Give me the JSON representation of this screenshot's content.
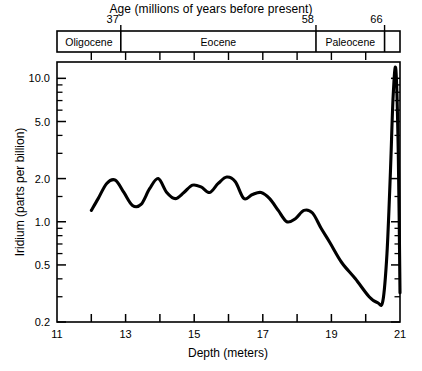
{
  "figure": {
    "top_axis_title": "Age (millions of years before present)",
    "bottom_axis_title": "Depth (meters)",
    "y_axis_title": "Iridium (parts per billion)"
  },
  "chart_data": {
    "type": "line",
    "title": "",
    "xlabel": "Depth (meters)",
    "ylabel": "Iridium (parts per billion)",
    "xlim": [
      11,
      21
    ],
    "ylim": [
      0.2,
      13
    ],
    "yscale": "log",
    "xscale": "linear",
    "grid": false,
    "legend": null,
    "x_ticks": [
      11,
      12,
      13,
      14,
      15,
      16,
      17,
      18,
      19,
      20,
      21
    ],
    "x_tick_labels": [
      "11",
      "",
      "13",
      "",
      "15",
      "",
      "17",
      "",
      "19",
      "",
      "21"
    ],
    "y_ticks": [
      0.2,
      0.5,
      1.0,
      2.0,
      5.0,
      10.0
    ],
    "y_tick_labels": [
      "0.2",
      "0.5",
      "1.0",
      "2.0",
      "5.0",
      "10.0"
    ],
    "y_minor_ticks": [
      0.3,
      0.4,
      0.6,
      0.7,
      0.8,
      0.9,
      1.5,
      3.0,
      4.0,
      6.0,
      7.0,
      8.0,
      9.0
    ],
    "series": [
      {
        "name": "Iridium concentration",
        "x": [
          12.0,
          12.2,
          12.45,
          12.7,
          12.95,
          13.2,
          13.45,
          13.7,
          13.95,
          14.2,
          14.45,
          14.7,
          14.95,
          15.2,
          15.45,
          15.7,
          15.95,
          16.2,
          16.45,
          16.7,
          16.95,
          17.2,
          17.45,
          17.7,
          17.95,
          18.2,
          18.45,
          18.7,
          18.95,
          19.3,
          19.7,
          20.1,
          20.35,
          20.5,
          20.62,
          20.72,
          20.8,
          20.88,
          20.95,
          21.0
        ],
        "y": [
          1.2,
          1.45,
          1.85,
          1.95,
          1.6,
          1.3,
          1.32,
          1.7,
          2.0,
          1.6,
          1.45,
          1.6,
          1.8,
          1.75,
          1.6,
          1.85,
          2.05,
          1.9,
          1.45,
          1.55,
          1.6,
          1.45,
          1.2,
          1.0,
          1.05,
          1.2,
          1.15,
          0.9,
          0.72,
          0.52,
          0.4,
          0.3,
          0.272,
          0.28,
          0.6,
          2.2,
          7.5,
          11.5,
          3.0,
          0.32
        ]
      }
    ],
    "annotations": {
      "secondary_axis": {
        "name": "Age (millions of years before present)",
        "unit": "Ma",
        "ticks": [
          {
            "label": "37",
            "depth": 12.86
          },
          {
            "label": "58",
            "depth": 18.55
          },
          {
            "label": "66",
            "depth": 20.55
          }
        ],
        "intervals": [
          {
            "label": "Oligocene",
            "depth_start": 11.0,
            "depth_end": 12.86
          },
          {
            "label": "Eocene",
            "depth_start": 12.86,
            "depth_end": 18.55
          },
          {
            "label": "Paleocene",
            "depth_start": 18.55,
            "depth_end": 20.55
          },
          {
            "label": "",
            "depth_start": 20.55,
            "depth_end": 21.0
          }
        ],
        "minor_tick_depths": [
          12.0,
          13.0,
          14.0,
          15.0,
          16.0,
          17.0,
          18.0,
          19.0,
          20.0
        ]
      },
      "peak": {
        "label": "",
        "depth": 20.88,
        "value": 11.5
      }
    }
  }
}
